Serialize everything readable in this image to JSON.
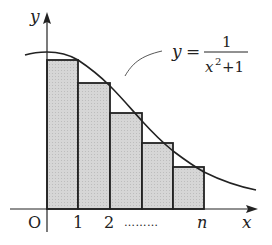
{
  "figure": {
    "axis_labels": {
      "x": "x",
      "y": "y",
      "origin": "O"
    },
    "tick_labels": [
      "1",
      "2",
      "n"
    ],
    "ellipsis": "………",
    "equation": {
      "lhs": "y",
      "eq": "=",
      "numerator": "1",
      "denominator_base": "x",
      "denominator_exp": "2",
      "denominator_rest": "+1"
    },
    "colors": {
      "rect_fill": "#d4d4d4",
      "stroke": "#222222"
    }
  }
}
